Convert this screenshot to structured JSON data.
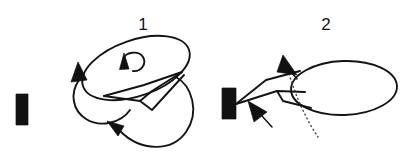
{
  "figure": {
    "kind": "line-diagram",
    "width": 415,
    "height": 161,
    "background_color": "#ffffff",
    "ink_color": "#141414",
    "dotted_color": "#4d4d4d"
  },
  "panels": [
    {
      "label": "1",
      "label_x": 143,
      "label_y": 28,
      "description": "tilted ellipse with curved spin arrow inside, wedge below, two looping motion arrows"
    },
    {
      "label": "2",
      "label_x": 326,
      "label_y": 28,
      "description": "horizontal ellipse with dotted hidden-edge line, wedge attached to black bar, two arrowheads"
    }
  ],
  "shapes": {
    "left_black_bar": {
      "name": "black-bar-left",
      "x": 16,
      "y": 94,
      "width": 12,
      "height": 31,
      "color": "#111111"
    },
    "right_black_bar": {
      "name": "black-bar-right",
      "x": 222,
      "y": 88,
      "width": 14,
      "height": 31,
      "color": "#111111"
    },
    "panel1_ellipse": {
      "name": "tilted-ellipse",
      "cx": 136,
      "cy": 68,
      "rx": 56,
      "ry": 28,
      "rotation_deg": -19
    },
    "panel2_ellipse": {
      "name": "horizontal-ellipse",
      "cx": 344,
      "cy": 88,
      "rx": 53,
      "ry": 27,
      "rotation_deg": -2
    }
  },
  "annotations": {
    "spin_arrow": "curved-rotation-arrow",
    "left_loop_arrow": "looping-motion-arrow-upper-left",
    "bottom_loop_arrow": "looping-motion-arrow-lower",
    "upper_arrowhead": "direction-arrowhead-upper",
    "lower_arrowhead": "direction-arrowhead-lower",
    "hidden_edge": "dotted-hidden-edge-line"
  }
}
